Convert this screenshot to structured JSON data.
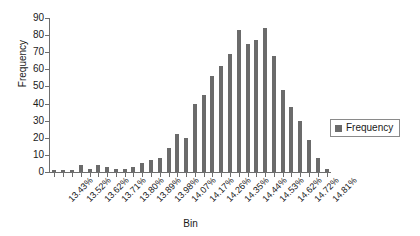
{
  "chart_data": {
    "type": "bar",
    "title": "",
    "xlabel": "Bin",
    "ylabel": "Frequency",
    "ylim": [
      0,
      90
    ],
    "ytick_step": 10,
    "yticks": [
      90,
      80,
      70,
      60,
      50,
      40,
      30,
      20,
      10,
      0
    ],
    "grid": false,
    "legend_position": "right",
    "legend": [
      "Frequency"
    ],
    "bar_color": "#6b6b6b",
    "categories": [
      "13.43%",
      "13.47%",
      "13.52%",
      "13.57%",
      "13.62%",
      "13.66%",
      "13.71%",
      "13.76%",
      "13.80%",
      "13.85%",
      "13.89%",
      "13.94%",
      "13.98%",
      "14.03%",
      "14.07%",
      "14.12%",
      "14.17%",
      "14.21%",
      "14.26%",
      "14.30%",
      "14.35%",
      "14.39%",
      "14.44%",
      "14.49%",
      "14.53%",
      "14.58%",
      "14.62%",
      "14.67%",
      "14.72%",
      "14.76%",
      "14.81%",
      "14.85%"
    ],
    "tick_labels_shown": [
      "13.43%",
      "13.52%",
      "13.62%",
      "13.71%",
      "13.80%",
      "13.89%",
      "13.98%",
      "14.07%",
      "14.17%",
      "14.26%",
      "14.35%",
      "14.44%",
      "14.53%",
      "14.62%",
      "14.72%",
      "14.81%"
    ],
    "series": [
      {
        "name": "Frequency",
        "values": [
          1,
          1,
          1,
          4,
          2,
          4,
          3,
          2,
          2,
          3,
          5,
          7,
          8,
          14,
          22,
          20,
          40,
          45,
          56,
          62,
          69,
          83,
          75,
          77,
          84,
          68,
          48,
          38,
          30,
          19,
          8,
          2
        ]
      }
    ]
  }
}
